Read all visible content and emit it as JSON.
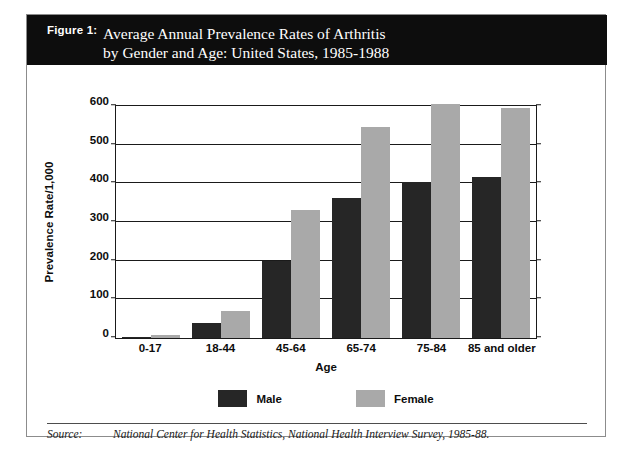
{
  "figure": {
    "label": "Figure 1:",
    "title_line1": "Average Annual Prevalence Rates of Arthritis",
    "title_line2": "by Gender and Age:  United States, 1985-1988"
  },
  "source": {
    "label": "Source:",
    "text": "National Center for Health Statistics, National Health Interview Survey, 1985-88."
  },
  "colors": {
    "male": "#262626",
    "female": "#a9a9a9",
    "banner": "#0d0d0d",
    "axis": "#1a1a1a",
    "frame": "#8c8c8c"
  },
  "chart_data": {
    "type": "bar",
    "title": "Average Annual Prevalence Rates of Arthritis by Gender and Age:  United States, 1985-1988",
    "xlabel": "Age",
    "ylabel": "Prevalence Rate/1,000",
    "categories": [
      "0-17",
      "18-44",
      "45-64",
      "65-74",
      "75-84",
      "85 and older"
    ],
    "series": [
      {
        "name": "Male",
        "color": "#262626",
        "values": [
          3,
          38,
          197,
          360,
          399,
          412
        ]
      },
      {
        "name": "Female",
        "color": "#a9a9a9",
        "values": [
          7,
          70,
          328,
          541,
          601,
          590
        ]
      }
    ],
    "ylim": [
      0,
      600
    ],
    "yticks": [
      0,
      100,
      200,
      300,
      400,
      500,
      600
    ],
    "ytick_labels": [
      "0",
      "100",
      "200",
      "300",
      "400",
      "500",
      "600"
    ],
    "grid": true,
    "legend_position": "bottom",
    "legend_entries": [
      "Male",
      "Female"
    ]
  }
}
